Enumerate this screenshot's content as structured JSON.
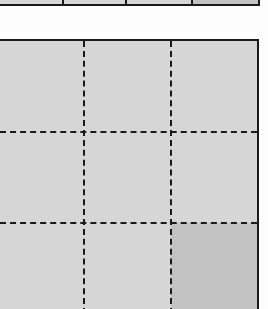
{
  "figure": {
    "colors": {
      "cell_fill": "#d6d6d6",
      "cell_fill_dark": "#c2c2c2",
      "line": "#1a1a1a",
      "background": "#fdfdfd"
    },
    "top_strip": {
      "cells": [
        {
          "index": 0,
          "width": 64,
          "shade": "light"
        },
        {
          "index": 1,
          "width": 64,
          "shade": "light"
        },
        {
          "index": 2,
          "width": 66,
          "shade": "light"
        },
        {
          "index": 3,
          "width": 66,
          "shade": "dark"
        }
      ]
    },
    "grid": {
      "rows": 3,
      "cols": 3,
      "col_widths": [
        84,
        87,
        86
      ],
      "row_heights": [
        91,
        91,
        91
      ],
      "cells": [
        {
          "row": 0,
          "col": 0,
          "shade": "light"
        },
        {
          "row": 0,
          "col": 1,
          "shade": "light"
        },
        {
          "row": 0,
          "col": 2,
          "shade": "light"
        },
        {
          "row": 1,
          "col": 0,
          "shade": "light"
        },
        {
          "row": 1,
          "col": 1,
          "shade": "light"
        },
        {
          "row": 1,
          "col": 2,
          "shade": "light"
        },
        {
          "row": 2,
          "col": 0,
          "shade": "light"
        },
        {
          "row": 2,
          "col": 1,
          "shade": "light"
        },
        {
          "row": 2,
          "col": 2,
          "shade": "dark"
        }
      ]
    }
  }
}
